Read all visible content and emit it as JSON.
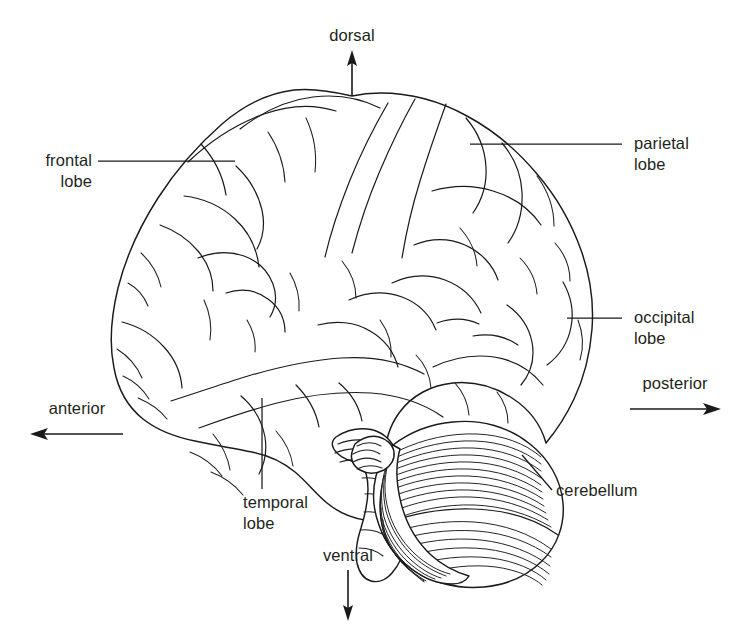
{
  "figure": {
    "background_color": "#ffffff",
    "ink_color": "#1a1a1a",
    "text_color": "#231f20",
    "width": 733,
    "height": 638
  },
  "structure_labels": {
    "frontal_lobe": "frontal\nlobe",
    "parietal_lobe": "parietal\nlobe",
    "occipital_lobe": "occipital\nlobe",
    "temporal_lobe": "temporal\nlobe",
    "cerebellum": "cerebellum"
  },
  "axis_labels": {
    "dorsal": "dorsal",
    "ventral": "ventral",
    "anterior": "anterior",
    "posterior": "posterior"
  },
  "axes": [
    {
      "name": "dorsal",
      "label": "dorsal",
      "direction": "up"
    },
    {
      "name": "ventral",
      "label": "ventral",
      "direction": "down"
    },
    {
      "name": "anterior",
      "label": "anterior",
      "direction": "left"
    },
    {
      "name": "posterior",
      "label": "posterior",
      "direction": "right"
    }
  ],
  "callouts": [
    {
      "name": "frontal-lobe",
      "label": "frontal\nlobe",
      "side": "left"
    },
    {
      "name": "parietal-lobe",
      "label": "parietal\nlobe",
      "side": "right"
    },
    {
      "name": "occipital-lobe",
      "label": "occipital\nlobe",
      "side": "right"
    },
    {
      "name": "temporal-lobe",
      "label": "temporal\nlobe",
      "side": "below"
    },
    {
      "name": "cerebellum",
      "label": "cerebellum",
      "side": "right"
    }
  ]
}
